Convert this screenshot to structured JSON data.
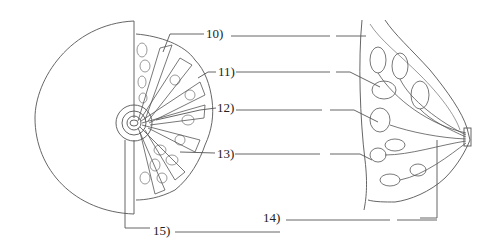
{
  "diagram": {
    "type": "anatomical-label-diagram",
    "line_color": "#555555",
    "background": "#ffffff",
    "labels": [
      {
        "id": "10",
        "text": "10)",
        "answer_blank": true
      },
      {
        "id": "11",
        "text": "11)",
        "answer_blank": true
      },
      {
        "id": "12",
        "text": "12)",
        "answer_blank": true
      },
      {
        "id": "13",
        "text": "13)",
        "answer_blank": true
      },
      {
        "id": "14",
        "text": "14)",
        "answer_blank": true
      },
      {
        "id": "15",
        "text": "15)",
        "answer_blank": true
      }
    ],
    "panels": [
      {
        "name": "frontal-view",
        "description": "half-circle breast outline with cutaway showing lobes radiating from nipple/areola"
      },
      {
        "name": "sagittal-view",
        "description": "side cross-section showing lobules, ducts and nipple"
      }
    ]
  }
}
